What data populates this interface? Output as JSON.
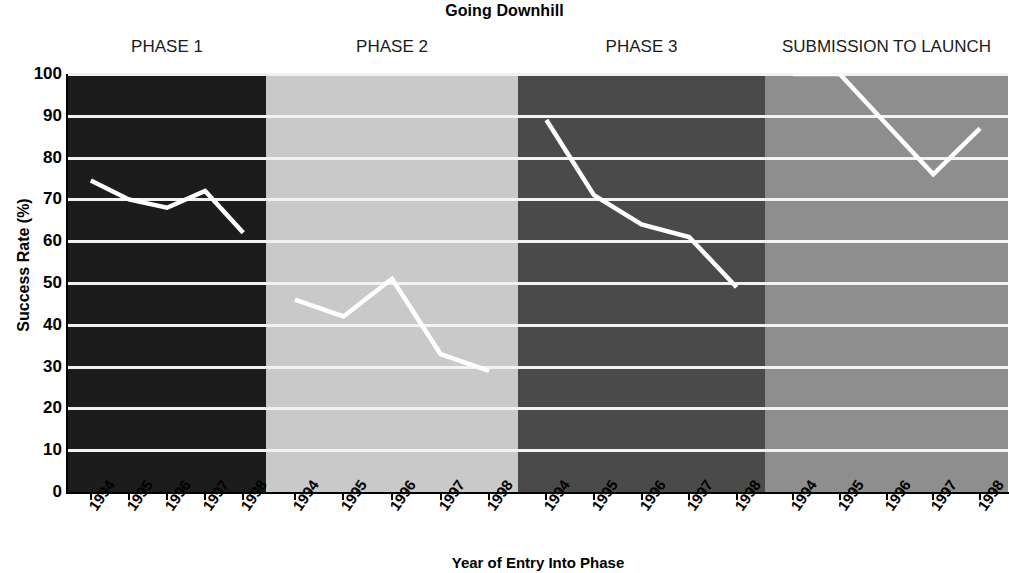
{
  "chart_data": {
    "type": "line",
    "title": "Going Downhill",
    "xlabel": "Year of Entry Into Phase",
    "ylabel": "Success Rate (%)",
    "ylim": [
      0,
      100
    ],
    "yticks": [
      100,
      90,
      80,
      70,
      60,
      50,
      40,
      30,
      20,
      10,
      0
    ],
    "categories": [
      "1994",
      "1995",
      "1996",
      "1997",
      "1998"
    ],
    "grid": true,
    "gridline_color": "#f2f2f2",
    "line_color": "#ffffff",
    "legend": "none",
    "panels": [
      {
        "name": "PHASE 1",
        "background": "#1c1c1c",
        "x": [
          "1994",
          "1995",
          "1996",
          "1997",
          "1998"
        ],
        "values": [
          74.5,
          70,
          68,
          72,
          62
        ]
      },
      {
        "name": "PHASE 2",
        "background": "#c9c9c9",
        "x": [
          "1994",
          "1995",
          "1996",
          "1997",
          "1998"
        ],
        "values": [
          46,
          42,
          51,
          33,
          29
        ]
      },
      {
        "name": "PHASE 3",
        "background": "#4a4a4a",
        "x": [
          "1994",
          "1995",
          "1996",
          "1997",
          "1998"
        ],
        "values": [
          89,
          71,
          64,
          61,
          49
        ]
      },
      {
        "name": "SUBMISSION TO LAUNCH",
        "background": "#8e8e8e",
        "x": [
          "1994",
          "1995",
          "1996",
          "1997",
          "1998"
        ],
        "values": [
          100,
          100,
          88,
          76,
          87
        ]
      }
    ]
  }
}
